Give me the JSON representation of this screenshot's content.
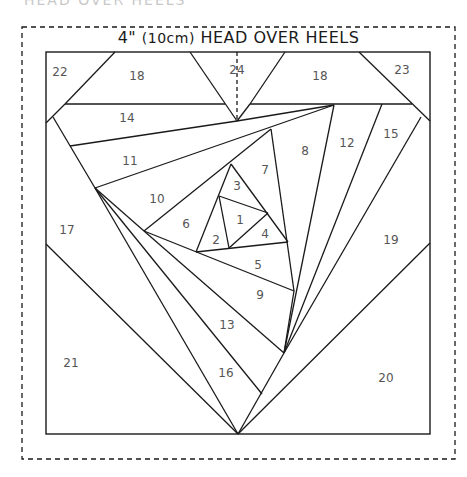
{
  "header": {
    "cropped_text": "HEAD OVER HEELS",
    "title_size": "4\"",
    "title_metric": "(10cm)",
    "title_name": "HEAD OVER HEELS"
  },
  "colors": {
    "line": "#1a1a1a",
    "label": "#555555",
    "background": "#ffffff"
  },
  "pieces": [
    {
      "id": "1",
      "label": "1"
    },
    {
      "id": "2",
      "label": "2"
    },
    {
      "id": "3",
      "label": "3"
    },
    {
      "id": "4",
      "label": "4"
    },
    {
      "id": "5",
      "label": "5"
    },
    {
      "id": "6",
      "label": "6"
    },
    {
      "id": "7",
      "label": "7"
    },
    {
      "id": "8",
      "label": "8"
    },
    {
      "id": "9",
      "label": "9"
    },
    {
      "id": "10",
      "label": "10"
    },
    {
      "id": "11",
      "label": "11"
    },
    {
      "id": "12",
      "label": "12"
    },
    {
      "id": "13",
      "label": "13"
    },
    {
      "id": "14",
      "label": "14"
    },
    {
      "id": "15",
      "label": "15"
    },
    {
      "id": "16",
      "label": "16"
    },
    {
      "id": "17",
      "label": "17"
    },
    {
      "id": "18a",
      "label": "18"
    },
    {
      "id": "18b",
      "label": "18"
    },
    {
      "id": "19",
      "label": "19"
    },
    {
      "id": "20",
      "label": "20"
    },
    {
      "id": "21",
      "label": "21"
    },
    {
      "id": "22",
      "label": "22"
    },
    {
      "id": "23",
      "label": "23"
    },
    {
      "id": "24",
      "label": "24"
    }
  ]
}
